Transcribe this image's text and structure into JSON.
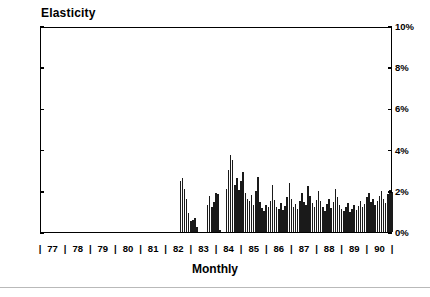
{
  "chart_data": {
    "type": "bar",
    "title": "Elasticity",
    "xlabel": "Monthly",
    "ylabel": "",
    "ylim": [
      0,
      10
    ],
    "ytick_labels": [
      "0%",
      "2%",
      "4%",
      "6%",
      "8%",
      "10%"
    ],
    "ytick_values": [
      0,
      2,
      4,
      6,
      8,
      10
    ],
    "y_axis_left_labels": [
      "10%",
      "8%",
      "6%",
      "4%",
      "2%",
      "0%"
    ],
    "y_axis_right_labels": [
      "10%",
      "8%",
      "6%",
      "4%",
      "2%",
      "0%"
    ],
    "grid": false,
    "legend": null,
    "x_tick_labels": [
      "77",
      "78",
      "79",
      "80",
      "81",
      "82",
      "83",
      "84",
      "85",
      "86",
      "87",
      "88",
      "89",
      "90"
    ],
    "x_separator": "|",
    "x_separator_count": 14,
    "series_name": "Elasticity",
    "bar_color": "#1a1a1a",
    "note": "Monthly series; values are zero from 1977 through mid-1982, then sporadic, then continuous from 1984 onward.",
    "x_start_year": 1977,
    "x_end_year": 1991,
    "values": [
      0,
      0,
      0,
      0,
      0,
      0,
      0,
      0,
      0,
      0,
      0,
      0,
      0,
      0,
      0,
      0,
      0,
      0,
      0,
      0,
      0,
      0,
      0,
      0,
      0,
      0,
      0,
      0,
      0,
      0,
      0,
      0,
      0,
      0,
      0,
      0,
      0,
      0,
      0,
      0,
      0,
      0,
      0,
      0,
      0,
      0,
      0,
      0,
      0,
      0,
      0,
      0,
      0,
      0,
      0,
      0,
      0,
      0,
      0,
      0,
      0,
      0,
      0,
      0,
      0,
      0,
      2.5,
      2.6,
      2.1,
      1.6,
      0.9,
      0.55,
      0.6,
      0.7,
      0.25,
      0,
      0,
      0,
      0,
      1.3,
      1.75,
      1.2,
      1.45,
      1.9,
      1.85,
      0.1,
      0,
      0,
      2.1,
      3.0,
      3.75,
      3.5,
      2.3,
      2.6,
      2.05,
      2.5,
      2.9,
      1.9,
      1.6,
      1.5,
      1.8,
      1.3,
      2.0,
      2.65,
      1.45,
      1.15,
      1.0,
      1.3,
      1.2,
      1.5,
      2.3,
      1.55,
      1.2,
      1.1,
      1.4,
      1.05,
      1.25,
      1.7,
      2.4,
      1.6,
      1.2,
      1.35,
      1.1,
      1.5,
      1.9,
      1.45,
      1.3,
      2.25,
      1.75,
      1.4,
      1.2,
      1.55,
      2.0,
      1.5,
      1.2,
      1.0,
      1.35,
      1.6,
      1.15,
      1.45,
      2.1,
      1.7,
      1.3,
      1.1,
      1.0,
      1.2,
      1.4,
      0.95,
      1.1,
      1.3,
      1.05,
      1.25,
      1.5,
      1.2,
      1.35,
      1.7,
      1.9,
      1.45,
      1.6,
      1.3,
      1.5,
      1.75,
      2.0,
      1.6,
      1.4,
      1.85,
      2.05,
      1.95
    ]
  }
}
